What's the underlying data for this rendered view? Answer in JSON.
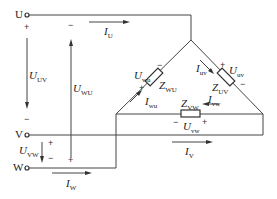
{
  "terminals": {
    "u": "U",
    "v": "V",
    "w": "W"
  },
  "voltages": {
    "uv_line": {
      "sym": "U",
      "sub": "UV"
    },
    "wu_line": {
      "sym": "U",
      "sub": "WU"
    },
    "vw_line": {
      "sym": "U",
      "sub": "VW"
    },
    "uv_phase": {
      "sym": "U",
      "sub": "uv"
    },
    "wu_phase": {
      "sym": "U",
      "sub": "wu"
    },
    "vw_phase": {
      "sym": "U",
      "sub": "vw"
    }
  },
  "currents": {
    "u": {
      "sym": "I",
      "sub": "U"
    },
    "v": {
      "sym": "I",
      "sub": "V"
    },
    "w": {
      "sym": "I",
      "sub": "W"
    },
    "uv": {
      "sym": "I",
      "sub": "uv"
    },
    "wu": {
      "sym": "I",
      "sub": "wu"
    },
    "vw": {
      "sym": "I",
      "sub": "vw"
    }
  },
  "impedances": {
    "uv": {
      "sym": "Z",
      "sub": "UV"
    },
    "wu": {
      "sym": "Z",
      "sub": "WU"
    },
    "vw": {
      "sym": "Z",
      "sub": "VW"
    }
  },
  "signs": {
    "plus": "+",
    "minus": "−"
  },
  "colors": {
    "line": "#333333",
    "text": "#222222"
  }
}
